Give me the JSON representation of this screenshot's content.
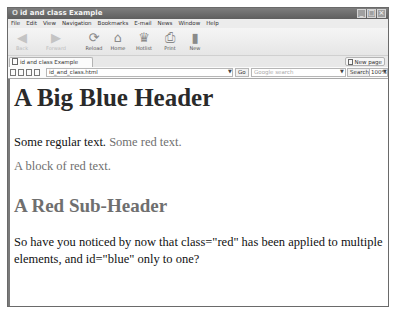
{
  "window": {
    "title": "id and class Example",
    "app_glyph": "O",
    "controls": {
      "minimize": "_",
      "maximize": "□",
      "close": "×"
    }
  },
  "menubar": {
    "items": [
      "File",
      "Edit",
      "View",
      "Navigation",
      "Bookmarks",
      "E-mail",
      "News",
      "Window",
      "Help"
    ]
  },
  "toolbar": {
    "buttons": [
      {
        "label": "Back",
        "icon": "◀",
        "enabled": false
      },
      {
        "label": "Forward",
        "icon": "▶",
        "enabled": false
      },
      {
        "label": "Reload",
        "icon": "⟳",
        "enabled": true
      },
      {
        "label": "Home",
        "icon": "⌂",
        "enabled": true
      },
      {
        "label": "Hotlist",
        "icon": "♛",
        "enabled": true
      },
      {
        "label": "Print",
        "icon": "⎙",
        "enabled": true
      },
      {
        "label": "New",
        "icon": "▮",
        "enabled": true
      }
    ]
  },
  "tabs": {
    "active": {
      "label": "id and class Example"
    },
    "new_page_label": "New page"
  },
  "addressbar": {
    "url": "id_and_class.html",
    "go_label": "Go",
    "search_placeholder": "Google search",
    "search_label": "Search",
    "zoom": "100%"
  },
  "page": {
    "h1": "A Big Blue Header",
    "p1_regular": "Some regular text. ",
    "p1_red": "Some red text.",
    "p2_red": "A block of red text.",
    "h2_red": "A Red Sub-Header",
    "p3": "So have you noticed by now that class=\"red\" has been applied to multiple elements, and id=\"blue\" only to one?"
  },
  "colors": {
    "title_bar": "#5e5e5e",
    "red_class_text": "#6f6f6f",
    "blue_id_text": "#2a2a2a"
  }
}
